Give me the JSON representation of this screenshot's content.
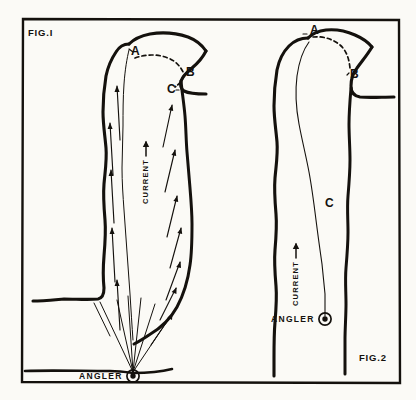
{
  "figure": {
    "title_fig1": "FIG.I",
    "title_fig2": "FIG.2",
    "background_color": "#fbfaf6",
    "ink_color": "#14110d"
  },
  "fig1": {
    "name": "FIG.I",
    "label": "FIG.I",
    "points": [
      {
        "id": "A",
        "label": "A",
        "x": 132,
        "y": 53
      },
      {
        "id": "B",
        "label": "B",
        "x": 185,
        "y": 73
      },
      {
        "id": "C",
        "label": "C",
        "x": 172,
        "y": 89
      }
    ],
    "current": {
      "label": "CURRENT",
      "arrow": "up-arrow-icon",
      "direction": "up"
    },
    "angler": {
      "label": "ANGLER",
      "marker": "target-dot-icon",
      "x": 133,
      "y": 376
    },
    "cast_lines_count": 6,
    "flow_arrows_left_count": 5,
    "flow_arrows_right_count": 7
  },
  "fig2": {
    "name": "FIG.2",
    "label": "FIG.2",
    "points": [
      {
        "id": "A",
        "label": "A",
        "x": 310,
        "y": 32
      },
      {
        "id": "B",
        "label": "B",
        "x": 348,
        "y": 76
      },
      {
        "id": "C",
        "label": "C",
        "x": 328,
        "y": 203
      }
    ],
    "current": {
      "label": "CURRENT",
      "arrow": "up-arrow-icon",
      "direction": "up"
    },
    "angler": {
      "label": "ANGLER",
      "marker": "target-dot-icon",
      "x": 325,
      "y": 319
    },
    "cast_lines_count": 1
  }
}
